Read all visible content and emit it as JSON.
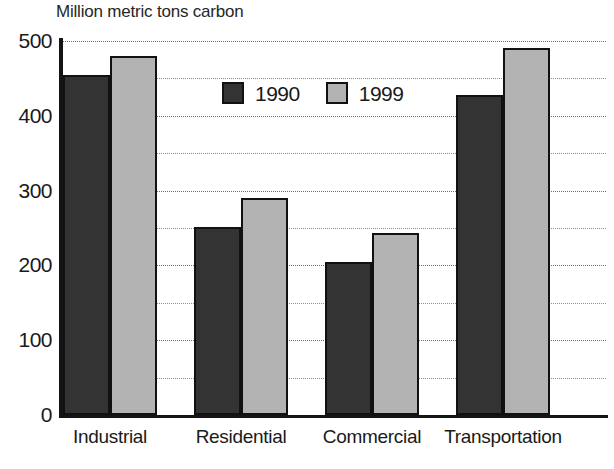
{
  "chart_data": {
    "type": "bar",
    "title": "Million metric tons carbon",
    "xlabel": "",
    "ylabel": "",
    "ylim": [
      0,
      500
    ],
    "ytick_step": 100,
    "gridline_step": 50,
    "grid": true,
    "legend_position": "upper-center",
    "categories": [
      "Industrial",
      "Residential",
      "Commercial",
      "Transportation"
    ],
    "series": [
      {
        "name": "1990",
        "color": "#333333",
        "values": [
          455,
          252,
          205,
          428
        ]
      },
      {
        "name": "1999",
        "color": "#b3b3b3",
        "values": [
          480,
          290,
          243,
          490
        ]
      }
    ],
    "yticks": [
      {
        "value": 500,
        "label": "500"
      },
      {
        "value": 400,
        "label": "400"
      },
      {
        "value": 300,
        "label": "300"
      },
      {
        "value": 200,
        "label": "200"
      },
      {
        "value": 100,
        "label": "100"
      },
      {
        "value": 0,
        "label": "0"
      }
    ],
    "gridlines": [
      500,
      450,
      400,
      350,
      300,
      250,
      200,
      150,
      100,
      50
    ],
    "colors": {
      "axis": "#141414",
      "grid": "#8e8e8e",
      "text": "#1a1a1a",
      "background": "#ffffff",
      "bar_border": "#111111"
    }
  }
}
